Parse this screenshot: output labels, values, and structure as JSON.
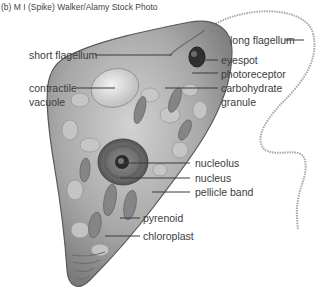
{
  "credit": "(b) M I (Spike) Walker/Alamy Stock Photo",
  "labels": {
    "short_flagellum": "short flagellum",
    "contractile_vacuole_1": "contractile",
    "contractile_vacuole_2": "vacuole",
    "long_flagellum": "long flagellum",
    "eyespot": "eyespot",
    "photoreceptor": "photoreceptor",
    "carbohydrate_granule_1": "carbohydrate",
    "carbohydrate_granule_2": "granule",
    "nucleolus": "nucleolus",
    "nucleus": "nucleus",
    "pellicle_band": "pellicle band",
    "pyrenoid": "pyrenoid",
    "chloroplast": "chloroplast"
  },
  "colors": {
    "cell_fill": "#b9b9b9",
    "cell_dark": "#6e6e6e",
    "leader_line": "#3a3a3a",
    "text": "#3c3c3c"
  }
}
